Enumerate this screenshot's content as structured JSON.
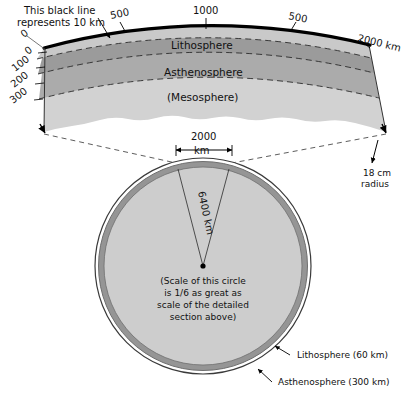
{
  "figure": {
    "title_note": "This black line represents 10 km",
    "colors": {
      "line": "#000000",
      "lithosphere_fill": "#c9c9c9",
      "asthenosphere_fill": "#9a9a9a",
      "mesosphere_fill": "#aaaaaa",
      "lower_fill": "#cfcfcf",
      "circle_ring": "#8f8f8f",
      "circle_fill": "#cccccc",
      "background": "#ffffff",
      "text": "#111111"
    }
  },
  "detail_section": {
    "callout_black_line": "This black line represents 10 km",
    "surface_ticks": [
      {
        "label": "500"
      },
      {
        "label": "1000"
      },
      {
        "label": "500"
      },
      {
        "label": "2000 km"
      }
    ],
    "depth_scale": {
      "top_zero": "0",
      "ticks": [
        "0",
        "100",
        "200",
        "300"
      ]
    },
    "bands": [
      {
        "name": "lithosphere",
        "label": "Lithosphere"
      },
      {
        "name": "asthenosphere",
        "label": "Asthenosphere"
      },
      {
        "name": "mesosphere",
        "label": "(Mesosphere)"
      }
    ],
    "radius_callout": {
      "line1": "18 cm",
      "line2": "radius"
    }
  },
  "globe_section": {
    "width_dimension": {
      "value": "2000",
      "unit": "km"
    },
    "radius_label": "6400 km",
    "scale_note": [
      "(Scale of this circle",
      "is 1/6 as great as",
      "scale of the detailed",
      "section above)"
    ],
    "annotations": [
      {
        "name": "lithosphere",
        "label": "Lithosphere (60 km)"
      },
      {
        "name": "asthenosphere",
        "label": "Asthenosphere (300 km)"
      }
    ]
  }
}
